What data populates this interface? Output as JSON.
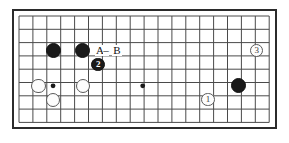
{
  "figure": {
    "name": "go-board-diagram",
    "background_color": "#ffffff",
    "board_color": "#ffffff",
    "line_color": "#4a4a4a",
    "border_color": "#2b2b2b",
    "black_color": "#1a1a1a",
    "white_color": "#fdfdfd",
    "white_outline_color": "#5a5a5a"
  },
  "board": {
    "left": 12,
    "top": 9,
    "width": 265,
    "height": 120,
    "columns": 19,
    "rows": 9,
    "cell_width": 13.9,
    "cell_height": 13.3,
    "origin_x": 19,
    "origin_y": 16
  },
  "star_points": [
    {
      "name": "star-point-left",
      "col": 2.45,
      "row": 5.25
    },
    {
      "name": "star-point-center",
      "col": 8.9,
      "row": 5.25
    }
  ],
  "stones": [
    {
      "id": "black-stone-a",
      "color": "black",
      "label": "",
      "col": 2.45,
      "row": 2.6,
      "radius": 7.5
    },
    {
      "id": "black-stone-b",
      "color": "black",
      "label": "",
      "col": 4.6,
      "row": 2.6,
      "radius": 7.5
    },
    {
      "id": "black-stone-2",
      "color": "black",
      "label": "2",
      "col": 5.7,
      "row": 3.65,
      "radius": 6.8
    },
    {
      "id": "black-stone-right",
      "color": "black",
      "label": "",
      "col": 15.8,
      "row": 5.25,
      "radius": 7.5
    },
    {
      "id": "white-stone-left",
      "color": "white",
      "label": "",
      "col": 1.4,
      "row": 5.25,
      "radius": 7.2
    },
    {
      "id": "white-stone-lower",
      "color": "white",
      "label": "",
      "col": 2.45,
      "row": 6.3,
      "radius": 7.2
    },
    {
      "id": "white-stone-mid",
      "color": "white",
      "label": "",
      "col": 4.6,
      "row": 5.25,
      "radius": 7.2
    },
    {
      "id": "white-stone-1",
      "color": "white",
      "label": "1",
      "col": 13.6,
      "row": 6.3,
      "radius": 6.6
    },
    {
      "id": "white-stone-3",
      "color": "white",
      "label": "3",
      "col": 17.1,
      "row": 2.6,
      "radius": 6.6
    }
  ],
  "markers": [
    {
      "id": "marker-a",
      "text": "A",
      "col": 5.75,
      "row": 2.6
    },
    {
      "id": "marker-dash",
      "text": "–",
      "col": 6.35,
      "row": 2.6
    },
    {
      "id": "marker-b",
      "text": "B",
      "col": 7.0,
      "row": 2.6
    }
  ]
}
